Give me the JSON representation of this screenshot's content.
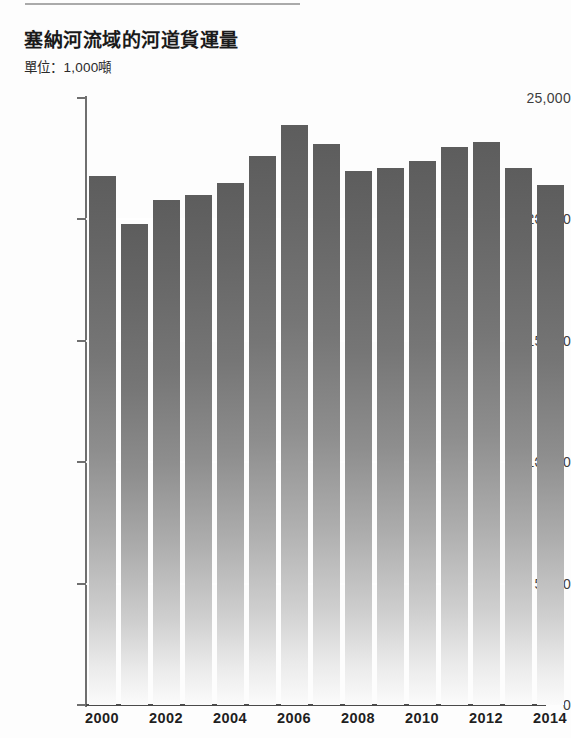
{
  "chart_data": {
    "type": "bar",
    "title": "塞納河流域的河道貨運量",
    "subtitle": "單位：1,000噸",
    "xlabel": "",
    "ylabel": "",
    "ylim": [
      0,
      25000
    ],
    "ytick_values": [
      25000,
      20000,
      15000,
      10000,
      5000,
      0
    ],
    "ytick_labels": [
      "25,000",
      "20,000",
      "15,000",
      "10,000",
      "5,000",
      "0"
    ],
    "grid": "horizontal-white-over-bars",
    "legend": "none",
    "categories": [
      "2000",
      "2001",
      "2002",
      "2003",
      "2004",
      "2005",
      "2006",
      "2007",
      "2008",
      "2009",
      "2010",
      "2011",
      "2012",
      "2013",
      "2014"
    ],
    "xtick_labels_shown": [
      "2000",
      "2002",
      "2004",
      "2006",
      "2008",
      "2010",
      "2012",
      "2014"
    ],
    "values": [
      21800,
      19800,
      20800,
      21000,
      21500,
      22600,
      23900,
      23100,
      22000,
      22100,
      22400,
      23000,
      23200,
      22100,
      21400
    ],
    "series": [
      {
        "name": "河道貨運量",
        "values": [
          21800,
          19800,
          20800,
          21000,
          21500,
          22600,
          23900,
          23100,
          22000,
          22100,
          22400,
          23000,
          23200,
          22100,
          21400
        ]
      }
    ],
    "bar_color_top": "#5d5d5d",
    "bar_color_bottom": "#fbfbfb",
    "gridline_color": "#ffffff",
    "axis_color": "#4a4a4a"
  }
}
